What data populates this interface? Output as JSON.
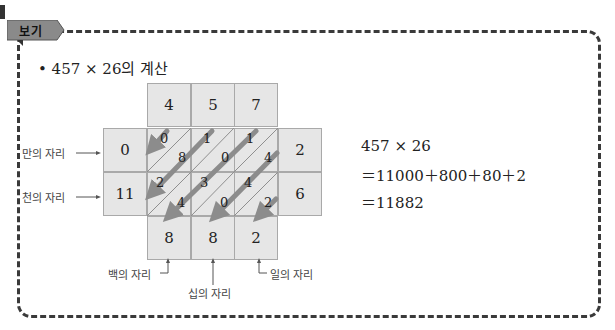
{
  "badge": {
    "label": "보기"
  },
  "title": "• 457 × 26의 계산",
  "grid": {
    "multiplicand": [
      "4",
      "5",
      "7"
    ],
    "multiplier": [
      "2",
      "6"
    ],
    "left_carries": [
      "0",
      "11"
    ],
    "bottom_digits": [
      "8",
      "8",
      "2"
    ],
    "cells": [
      [
        {
          "tens": "0",
          "ones": "8"
        },
        {
          "tens": "1",
          "ones": "0"
        },
        {
          "tens": "1",
          "ones": "4"
        }
      ],
      [
        {
          "tens": "2",
          "ones": "4"
        },
        {
          "tens": "3",
          "ones": "0"
        },
        {
          "tens": "4",
          "ones": "2"
        }
      ]
    ]
  },
  "labels": {
    "ten_thousands": "만의 자리",
    "thousands": "천의 자리",
    "hundreds": "백의 자리",
    "tens": "십의 자리",
    "ones": "일의 자리"
  },
  "equation": {
    "line1": "457 × 26",
    "line2": "＝11000＋800＋80＋2",
    "line3": "＝11882"
  },
  "colors": {
    "cell_fill": "#e6e6e6",
    "cell_border": "#a9a9a9",
    "arrow": "#8c8c8c",
    "badge": "#8a8a8a",
    "frame": "#3a3a3a"
  }
}
